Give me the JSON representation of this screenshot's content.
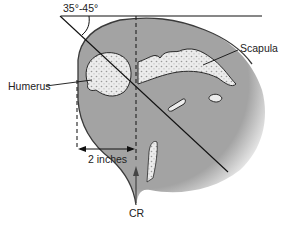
{
  "figure": {
    "angle_label": "35°-45°",
    "labels": {
      "humerus": "Humerus",
      "scapula": "Scapula",
      "distance": "2 inches",
      "central_ray": "CR"
    },
    "colors": {
      "soft_tissue": "#a3a3a3",
      "soft_tissue_edge": "#3a3a3a",
      "bone": "#ececec",
      "bone_texture": "#9a9a9a",
      "line": "#111111"
    }
  }
}
